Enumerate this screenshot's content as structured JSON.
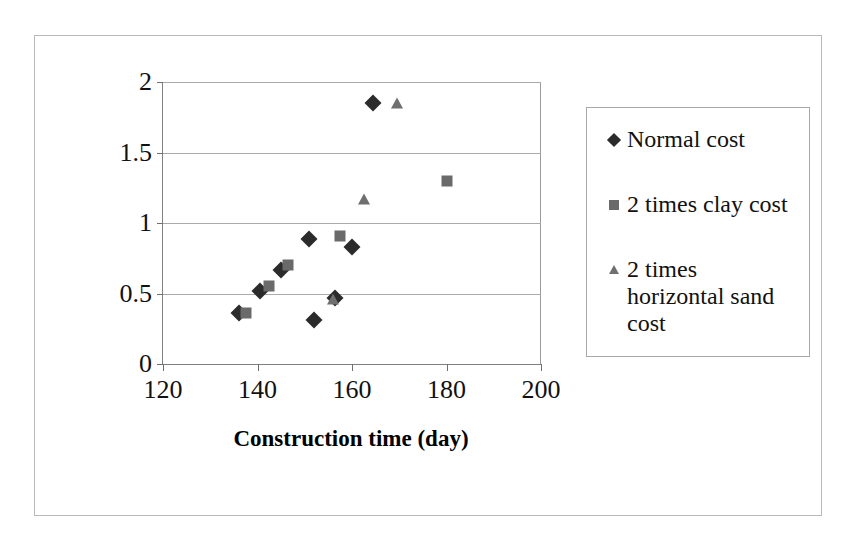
{
  "chart_data": {
    "type": "scatter",
    "title": "",
    "xlabel": "Construction time (day)",
    "ylabel": "Clay layer thickness (m)",
    "xlim": [
      120,
      200
    ],
    "ylim": [
      0,
      2
    ],
    "xticks": [
      "120",
      "140",
      "160",
      "180",
      "200"
    ],
    "yticks": [
      "0",
      "0.5",
      "1",
      "1.5",
      "2"
    ],
    "grid": "horizontal",
    "legend_position": "right",
    "series": [
      {
        "name": "Normal cost",
        "marker": "diamond",
        "color": "#2b2b2b",
        "points": [
          {
            "x": 136.0,
            "y": 0.36
          },
          {
            "x": 140.5,
            "y": 0.52
          },
          {
            "x": 145.0,
            "y": 0.67
          },
          {
            "x": 151.0,
            "y": 0.89
          },
          {
            "x": 152.0,
            "y": 0.31
          },
          {
            "x": 156.5,
            "y": 0.47
          },
          {
            "x": 160.0,
            "y": 0.83
          },
          {
            "x": 164.5,
            "y": 1.85
          }
        ]
      },
      {
        "name": "2 times clay cost",
        "marker": "square",
        "color": "#6a6a6a",
        "points": [
          {
            "x": 137.5,
            "y": 0.36
          },
          {
            "x": 142.5,
            "y": 0.55
          },
          {
            "x": 146.5,
            "y": 0.7
          },
          {
            "x": 157.5,
            "y": 0.91
          },
          {
            "x": 180.0,
            "y": 1.3
          }
        ]
      },
      {
        "name": "2 times horizontal sand cost",
        "marker": "triangle",
        "color": "#6f6f6f",
        "points": [
          {
            "x": 156.0,
            "y": 0.46
          },
          {
            "x": 162.5,
            "y": 1.17
          },
          {
            "x": 169.5,
            "y": 1.85
          }
        ]
      }
    ]
  },
  "legend": {
    "entries": [
      {
        "label": "Normal cost",
        "marker": "diamond"
      },
      {
        "label": "2 times clay cost",
        "marker": "square"
      },
      {
        "label": "2 times horizontal sand cost",
        "marker": "triangle"
      }
    ]
  },
  "colors": {
    "diamond": "#2b2b2b",
    "square": "#6a6a6a",
    "triangle": "#6f6f6f",
    "gridline": "#aaaaaa",
    "axis": "#808080",
    "frame": "#b9b9b9"
  }
}
